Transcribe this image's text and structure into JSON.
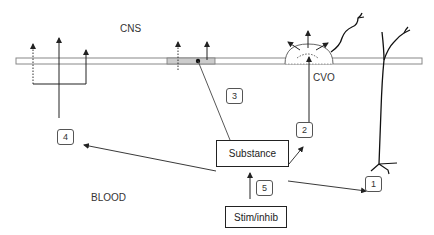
{
  "regions": {
    "cns": "CNS",
    "blood": "BLOOD",
    "cvo": "CVO"
  },
  "boxes": {
    "substance": "Substance",
    "stim_inhib": "Stim/inhib"
  },
  "route_numbers": [
    "1",
    "2",
    "3",
    "4",
    "5"
  ],
  "colors": {
    "line": "#222222",
    "barrier_fill": "#ffffff",
    "barrier_stroke": "#888888",
    "transport_region": "#cccccc"
  }
}
